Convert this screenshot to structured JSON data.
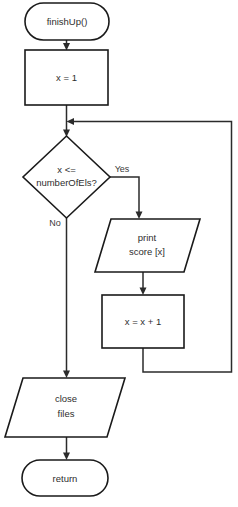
{
  "diagram": {
    "type": "flowchart",
    "nodes": {
      "start": {
        "label": "finishUp()",
        "shape": "terminator"
      },
      "init": {
        "label": "x = 1",
        "shape": "process"
      },
      "condition": {
        "line1": "x <=",
        "line2": "numberOfEls?",
        "shape": "decision"
      },
      "print": {
        "line1": "print",
        "line2": "score [x]",
        "shape": "input-output"
      },
      "increment": {
        "label": "x = x + 1",
        "shape": "process"
      },
      "close": {
        "line1": "close",
        "line2": "files",
        "shape": "input-output"
      },
      "end": {
        "label": "return",
        "shape": "terminator"
      }
    },
    "branches": {
      "yes": "Yes",
      "no": "No"
    },
    "colors": {
      "background": "#ffffff",
      "shape_stroke": "#1a1a1a",
      "connector_stroke": "#2b2b2b",
      "text": "#2e2e2e"
    }
  }
}
